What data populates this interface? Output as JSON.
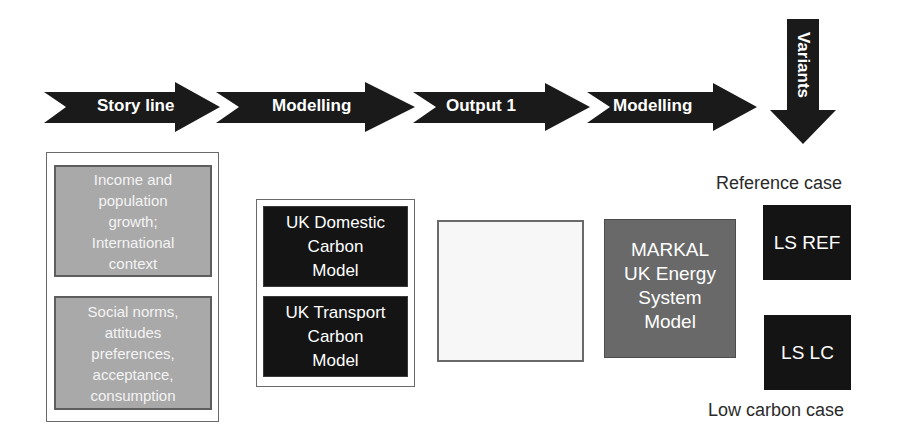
{
  "process_arrows": [
    {
      "label": "Story line"
    },
    {
      "label": "Modelling"
    },
    {
      "label": "Output 1"
    },
    {
      "label": "Modelling"
    }
  ],
  "variants_arrow": {
    "label": "Variants"
  },
  "storyline": {
    "boxes": [
      {
        "text": "Income and\npopulation\ngrowth;\nInternational\ncontext"
      },
      {
        "text": "Social norms,\nattitudes\npreferences,\nacceptance,\nconsumption"
      }
    ]
  },
  "models": {
    "boxes": [
      {
        "text": "UK Domestic\nCarbon\nModel"
      },
      {
        "text": "UK Transport\nCarbon\nModel"
      }
    ]
  },
  "output1": {
    "text": ""
  },
  "markal": {
    "text": "MARKAL\nUK Energy\nSystem\nModel"
  },
  "variants": {
    "reference": {
      "caption": "Reference case",
      "box": "LS REF"
    },
    "low_carbon": {
      "caption": "Low carbon case",
      "box": "LS LC"
    }
  },
  "colors": {
    "arrow": "#1a1a1a",
    "storyline_box": "#a9a9a9",
    "model_box": "#141414",
    "markal_box": "#696969",
    "output_box": "#f7f7f7"
  }
}
